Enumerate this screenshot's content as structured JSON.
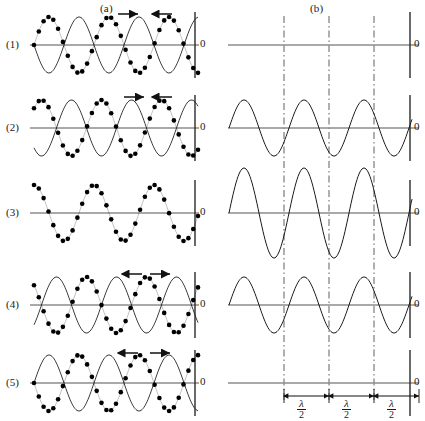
{
  "figure": {
    "title_panels": [
      {
        "id": "a",
        "label": "(a)",
        "x": 100,
        "y": 2
      },
      {
        "id": "b",
        "label": "(b)",
        "x": 310,
        "y": 2
      }
    ],
    "width": 425,
    "height": 421,
    "background": "#ffffff",
    "line_color": "#1a1a1a",
    "axis_color": "#8c8c8c",
    "dash_color": "#6e6e6e",
    "dot_color": "#000000"
  },
  "rows": [
    {
      "index": 1,
      "label": "(1)",
      "axis_y": 45,
      "zero_label": "0",
      "left": {
        "wave_thin": {
          "amplitude": 28,
          "phase_deg": 180,
          "wavelength": 60,
          "visible": true
        },
        "wave_dotted": {
          "amplitude": 28,
          "phase_deg": 0,
          "wavelength": 60,
          "visible": true,
          "dots": 34
        },
        "arrows": [
          {
            "direction": "right",
            "x": 118,
            "y": 14
          },
          {
            "direction": "left",
            "x": 152,
            "y": 14
          }
        ]
      },
      "right": {
        "resultant": {
          "amplitude": 0,
          "phase_deg": 0,
          "wavelength": 60,
          "visible": true
        },
        "description": "flat"
      }
    },
    {
      "index": 2,
      "label": "(2)",
      "axis_y": 128,
      "zero_label": "0",
      "left": {
        "wave_thin": {
          "amplitude": 28,
          "phase_deg": 225,
          "wavelength": 60,
          "visible": true
        },
        "wave_dotted": {
          "amplitude": 28,
          "phase_deg": 45,
          "wavelength": 60,
          "visible": true,
          "dots": 34
        },
        "arrows": [
          {
            "direction": "right",
            "x": 124,
            "y": 97
          },
          {
            "direction": "left",
            "x": 152,
            "y": 97
          }
        ]
      },
      "right": {
        "resultant": {
          "amplitude": 28,
          "phase_deg": 0,
          "wavelength": 60,
          "visible": true
        },
        "description": "medium"
      }
    },
    {
      "index": 3,
      "label": "(3)",
      "axis_y": 213,
      "zero_label": "0",
      "left": {
        "wave_thin": {
          "amplitude": 28,
          "phase_deg": 270,
          "wavelength": 60,
          "visible": false
        },
        "wave_dotted": {
          "amplitude": 28,
          "phase_deg": 90,
          "wavelength": 60,
          "visible": true,
          "dots": 34
        },
        "arrows": []
      },
      "right": {
        "resultant": {
          "amplitude": 45,
          "phase_deg": 0,
          "wavelength": 60,
          "visible": true
        },
        "description": "maximum"
      }
    },
    {
      "index": 4,
      "label": "(4)",
      "axis_y": 305,
      "zero_label": "0",
      "left": {
        "wave_thin": {
          "amplitude": 28,
          "phase_deg": 315,
          "wavelength": 60,
          "visible": true
        },
        "wave_dotted": {
          "amplitude": 28,
          "phase_deg": 135,
          "wavelength": 60,
          "visible": true,
          "dots": 34
        },
        "arrows": [
          {
            "direction": "left",
            "x": 122,
            "y": 274
          },
          {
            "direction": "right",
            "x": 150,
            "y": 274
          }
        ]
      },
      "right": {
        "resultant": {
          "amplitude": 28,
          "phase_deg": 0,
          "wavelength": 60,
          "visible": true
        },
        "description": "medium"
      }
    },
    {
      "index": 5,
      "label": "(5)",
      "axis_y": 383,
      "zero_label": "0",
      "left": {
        "wave_thin": {
          "amplitude": 28,
          "phase_deg": 0,
          "wavelength": 60,
          "visible": true
        },
        "wave_dotted": {
          "amplitude": 28,
          "phase_deg": 180,
          "wavelength": 60,
          "visible": true,
          "dots": 34
        },
        "arrows": [
          {
            "direction": "left",
            "x": 118,
            "y": 353
          },
          {
            "direction": "right",
            "x": 150,
            "y": 353
          }
        ]
      },
      "right": {
        "resultant": {
          "amplitude": 0,
          "phase_deg": 0,
          "wavelength": 60,
          "visible": true
        },
        "description": "flat"
      }
    }
  ],
  "node_lines": {
    "x_positions": [
      284,
      329,
      374
    ],
    "style": "dash-dot",
    "top": 16,
    "bottom": 400
  },
  "measurements": {
    "numerator": "λ",
    "denominator": "2",
    "segments": [
      {
        "x_start": 284,
        "x_end": 329,
        "label_numerator": "λ",
        "label_denominator": "2"
      },
      {
        "x_start": 329,
        "x_end": 374,
        "label_numerator": "λ",
        "label_denominator": "2"
      },
      {
        "x_start": 374,
        "x_end": 419,
        "label_numerator": "λ",
        "label_denominator": "2"
      }
    ],
    "baseline_y": 396
  },
  "axes": {
    "left_axis_x_start": 30,
    "left_axis_x_end": 199,
    "left_vertical_x": 195,
    "right_axis_x_start": 228,
    "right_axis_x_end": 419,
    "right_vertical_x": 410
  }
}
